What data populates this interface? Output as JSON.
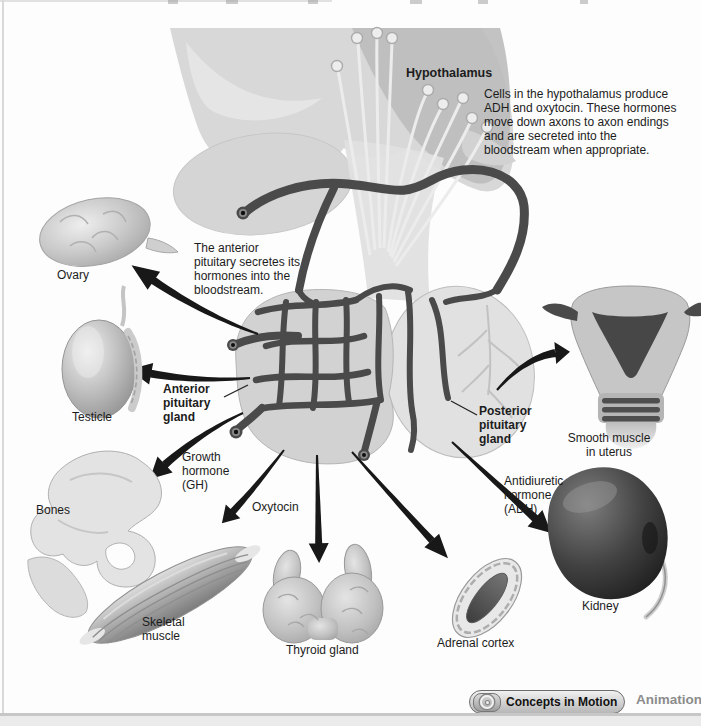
{
  "diagram": {
    "hypothalamus": {
      "label": "Hypothalamus",
      "note": "Cells in the hypothalamus produce\nADH and oxytocin. These hormones\nmove down axons to axon endings\nand are secreted into the\nbloodstream when appropriate."
    },
    "anterior_pituitary": {
      "label": "Anterior\npituitary\ngland",
      "note": "The anterior\npituitary secretes its\nhormones into the\nbloodstream."
    },
    "posterior_pituitary": {
      "label": "Posterior\npituitary\ngland"
    },
    "hormones": {
      "growth_hormone": "Growth\nhormone\n(GH)",
      "oxytocin": "Oxytocin",
      "adh": "Antidiuretic\nhormone\n(ADH)"
    },
    "organs": {
      "ovary": "Ovary",
      "testicle": "Testicle",
      "bones": "Bones",
      "skeletal_muscle": "Skeletal\nmuscle",
      "thyroid": "Thyroid gland",
      "adrenal_cortex": "Adrenal cortex",
      "kidney": "Kidney",
      "uterus": "Smooth muscle\nin uterus"
    }
  },
  "footer": {
    "button_label": "Concepts in Motion",
    "animation_label": "Animation",
    "motion_icon": "concentric-circles"
  },
  "colors": {
    "arrow": "#181818",
    "vessel": "#4a4a4a",
    "tissue": "#d8d8d8",
    "tissue_shade": "#bcbcbc",
    "kidney": "#2e2e2e",
    "footer_text": "#8c8c8c"
  }
}
